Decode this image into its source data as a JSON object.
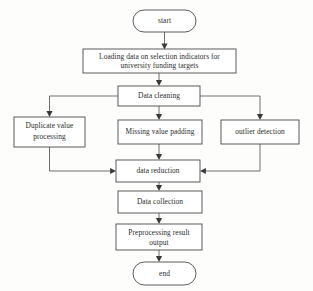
{
  "diagram": {
    "type": "flowchart",
    "orientation": "top-to-bottom",
    "canvas": {
      "width": 313,
      "height": 291
    },
    "colors": {
      "background": "#fdfdfc",
      "node_fill": "#ffffff",
      "node_stroke": "#4a4a4a",
      "edge_stroke": "#555555",
      "arrow_fill": "#3a3a3a",
      "text": "#2b2b2b"
    }
  },
  "nodes": [
    {
      "id": "start",
      "shape": "stadium",
      "label": "start",
      "lines": [
        "start"
      ],
      "x": 133,
      "y": 10,
      "w": 63,
      "h": 22
    },
    {
      "id": "loading",
      "shape": "rectangle",
      "label": "Loading data on selection indicators for university funding targets",
      "lines": [
        "Loading data on selection indicators for",
        "university funding targets"
      ],
      "x": 83,
      "y": 49,
      "w": 153,
      "h": 24
    },
    {
      "id": "data-cleaning",
      "shape": "rectangle",
      "label": "Data cleaning",
      "lines": [
        "Data cleaning"
      ],
      "x": 118,
      "y": 86,
      "w": 82,
      "h": 20
    },
    {
      "id": "duplicate-value-processing",
      "shape": "rectangle",
      "label": "Duplicate value processing",
      "lines": [
        "Duplicate value",
        "processing"
      ],
      "x": 14,
      "y": 117,
      "w": 71,
      "h": 30
    },
    {
      "id": "missing-value-padding",
      "shape": "rectangle",
      "label": "Missing value padding",
      "lines": [
        "Missing value padding"
      ],
      "x": 118,
      "y": 120,
      "w": 84,
      "h": 24
    },
    {
      "id": "outlier-detection",
      "shape": "rectangle",
      "label": "outlier detection",
      "lines": [
        "outlier detection"
      ],
      "x": 221,
      "y": 120,
      "w": 78,
      "h": 24
    },
    {
      "id": "data-reduction",
      "shape": "rectangle",
      "label": "data reduction",
      "lines": [
        "data reduction"
      ],
      "x": 116,
      "y": 160,
      "w": 84,
      "h": 22
    },
    {
      "id": "data-collection",
      "shape": "rectangle",
      "label": "Data collection",
      "lines": [
        "Data collection"
      ],
      "x": 118,
      "y": 191,
      "w": 84,
      "h": 22
    },
    {
      "id": "preprocessing-result-output",
      "shape": "rectangle",
      "label": "Preprocessing result output",
      "lines": [
        "Preprocessing result",
        "output"
      ],
      "x": 116,
      "y": 224,
      "w": 86,
      "h": 26
    },
    {
      "id": "end",
      "shape": "stadium",
      "label": "end",
      "lines": [
        "end"
      ],
      "x": 133,
      "y": 262,
      "w": 63,
      "h": 23
    }
  ],
  "edges": [
    {
      "id": "e1",
      "from": "start",
      "to": "loading",
      "style": "straight-down",
      "arrow": "down"
    },
    {
      "id": "e2",
      "from": "loading",
      "to": "data-cleaning",
      "style": "straight-down",
      "arrow": "down"
    },
    {
      "id": "e3",
      "from": "data-cleaning",
      "to": "duplicate-value-processing",
      "style": "left-elbow",
      "arrow": "down"
    },
    {
      "id": "e4",
      "from": "data-cleaning",
      "to": "missing-value-padding",
      "style": "straight-down",
      "arrow": "down"
    },
    {
      "id": "e5",
      "from": "data-cleaning",
      "to": "outlier-detection",
      "style": "right-elbow",
      "arrow": "down"
    },
    {
      "id": "e6",
      "from": "duplicate-value-processing",
      "to": "data-reduction",
      "style": "left-elbow",
      "arrow": "right"
    },
    {
      "id": "e7",
      "from": "missing-value-padding",
      "to": "data-reduction",
      "style": "straight-down",
      "arrow": "down"
    },
    {
      "id": "e8",
      "from": "outlier-detection",
      "to": "data-reduction",
      "style": "right-elbow",
      "arrow": "left"
    },
    {
      "id": "e9",
      "from": "data-reduction",
      "to": "data-collection",
      "style": "straight-down",
      "arrow": "down"
    },
    {
      "id": "e10",
      "from": "data-collection",
      "to": "preprocessing-result-output",
      "style": "straight-down",
      "arrow": "down"
    },
    {
      "id": "e11",
      "from": "preprocessing-result-output",
      "to": "end",
      "style": "straight-down",
      "arrow": "down"
    }
  ]
}
